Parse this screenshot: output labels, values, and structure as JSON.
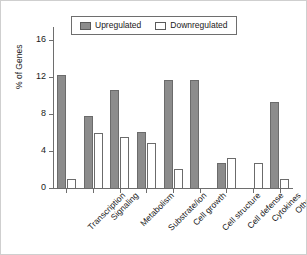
{
  "chart_data": {
    "type": "bar",
    "title": "",
    "xlabel": "",
    "ylabel": "% of Genes",
    "ylim": [
      0,
      17.5
    ],
    "yticks": [
      0,
      4,
      8,
      12,
      16
    ],
    "ytick_labels": [
      "0",
      "4",
      "8",
      "12",
      "16"
    ],
    "grid": false,
    "legend_position": "top-center",
    "categories": [
      "Transcription",
      "Signaling",
      "Metabolism",
      "Substrate/ion",
      "Cell growth",
      "Cell structure",
      "Cell defense",
      "Cytokines",
      "Others"
    ],
    "series": [
      {
        "name": "Upregulated",
        "color": "#8c8c8c",
        "values": [
          12.3,
          7.9,
          10.7,
          6.2,
          11.8,
          11.8,
          2.8,
          0,
          9.4
        ]
      },
      {
        "name": "Downregulated",
        "color": "#ffffff",
        "values": [
          1.1,
          6.1,
          5.6,
          5.0,
          2.2,
          0,
          3.3,
          2.8,
          1.1
        ]
      }
    ]
  },
  "legend": {
    "entries": [
      {
        "label": "Upregulated",
        "swatch": "filled-gray-swatch-icon"
      },
      {
        "label": "Downregulated",
        "swatch": "outline-white-swatch-icon"
      }
    ]
  }
}
